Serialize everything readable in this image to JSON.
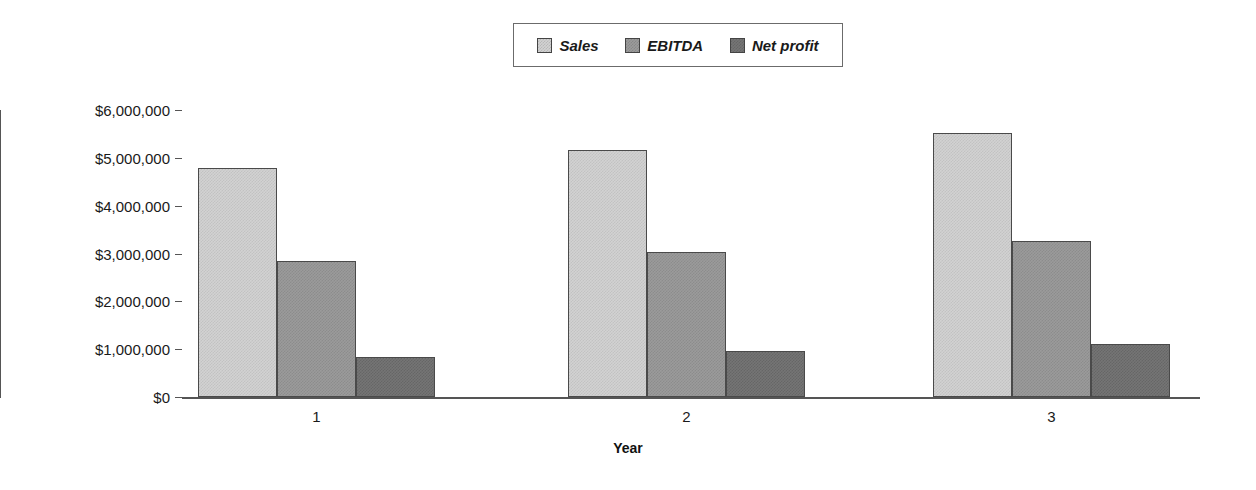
{
  "chart_data": {
    "type": "bar",
    "title": "",
    "xlabel": "Year",
    "ylabel": "",
    "categories": [
      "1",
      "2",
      "3"
    ],
    "series": [
      {
        "name": "Sales",
        "color": "#d2d2d2",
        "values": [
          4790000,
          5170000,
          5520000
        ]
      },
      {
        "name": "EBITDA",
        "color": "#9b9b9b",
        "values": [
          2840000,
          3030000,
          3270000
        ]
      },
      {
        "name": "Net profit",
        "color": "#757575",
        "values": [
          840000,
          970000,
          1100000
        ]
      }
    ],
    "ylim": [
      0,
      6000000
    ],
    "ytick_values": [
      6000000,
      5000000,
      4000000,
      3000000,
      2000000,
      1000000,
      0
    ],
    "ytick_labels": [
      "$6,000,000",
      "$5,000,000",
      "$4,000,000",
      "$3,000,000",
      "$2,000,000",
      "$1,000,000",
      "$0"
    ],
    "grid": false,
    "legend_position": "top-center",
    "legend_entries": [
      "Sales",
      "EBITDA",
      "Net profit"
    ]
  }
}
